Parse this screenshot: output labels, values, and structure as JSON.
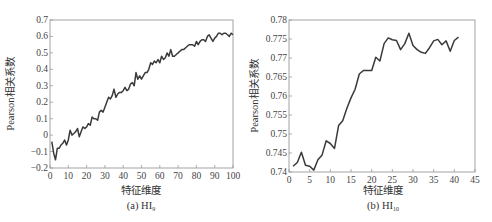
{
  "chart_data": [
    {
      "type": "line",
      "caption": "(a) HI",
      "caption_sub": "9",
      "title": "",
      "xlabel": "特征维度",
      "ylabel": "Pearson相关系数",
      "xlim": [
        0,
        100
      ],
      "ylim": [
        -0.2,
        0.7
      ],
      "xticks": [
        0,
        10,
        20,
        30,
        40,
        50,
        60,
        70,
        80,
        90,
        100
      ],
      "yticks": [
        -0.2,
        -0.1,
        0,
        0.1,
        0.2,
        0.3,
        0.4,
        0.5,
        0.6,
        0.7
      ],
      "ytick_labels": [
        "−0.2",
        "−0.1",
        "0",
        "0.1",
        "0.2",
        "0.3",
        "0.4",
        "0.5",
        "0.6",
        "0.7"
      ],
      "grid": false,
      "series": [
        {
          "name": "HI9",
          "x": [
            1,
            2,
            3,
            4,
            5,
            6,
            7,
            8,
            9,
            10,
            11,
            12,
            13,
            14,
            15,
            16,
            17,
            18,
            19,
            20,
            21,
            22,
            23,
            24,
            25,
            26,
            27,
            28,
            29,
            30,
            31,
            32,
            33,
            34,
            35,
            36,
            37,
            38,
            39,
            40,
            41,
            42,
            43,
            44,
            45,
            46,
            47,
            48,
            49,
            50,
            51,
            52,
            53,
            54,
            55,
            56,
            57,
            58,
            59,
            60,
            61,
            62,
            63,
            64,
            65,
            66,
            67,
            68,
            69,
            70,
            71,
            72,
            73,
            74,
            75,
            76,
            77,
            78,
            79,
            80,
            81,
            82,
            83,
            84,
            85,
            86,
            87,
            88,
            89,
            90,
            91,
            92,
            93,
            94,
            95,
            96,
            97,
            98,
            99,
            100
          ],
          "values": [
            -0.04,
            -0.11,
            -0.15,
            -0.08,
            -0.08,
            -0.06,
            -0.05,
            -0.03,
            -0.06,
            -0.03,
            0.03,
            0.0,
            0.01,
            0.02,
            0.04,
            -0.01,
            0.02,
            0.05,
            0.04,
            0.05,
            0.07,
            0.06,
            0.11,
            0.1,
            0.1,
            0.09,
            0.14,
            0.15,
            0.14,
            0.17,
            0.2,
            0.23,
            0.22,
            0.24,
            0.28,
            0.23,
            0.25,
            0.26,
            0.26,
            0.27,
            0.29,
            0.27,
            0.28,
            0.31,
            0.32,
            0.3,
            0.38,
            0.34,
            0.36,
            0.34,
            0.36,
            0.38,
            0.38,
            0.4,
            0.44,
            0.43,
            0.45,
            0.44,
            0.46,
            0.44,
            0.48,
            0.46,
            0.47,
            0.5,
            0.48,
            0.52,
            0.48,
            0.48,
            0.49,
            0.5,
            0.51,
            0.52,
            0.52,
            0.53,
            0.54,
            0.55,
            0.55,
            0.55,
            0.54,
            0.57,
            0.55,
            0.57,
            0.58,
            0.58,
            0.57,
            0.6,
            0.61,
            0.59,
            0.57,
            0.59,
            0.6,
            0.62,
            0.62,
            0.61,
            0.62,
            0.62,
            0.61,
            0.6,
            0.62,
            0.61
          ]
        }
      ]
    },
    {
      "type": "line",
      "caption": "(b) HI",
      "caption_sub": "10",
      "title": "",
      "xlabel": "特征维度",
      "ylabel": "Pearson相关系数",
      "xlim": [
        0,
        45
      ],
      "ylim": [
        0.74,
        0.78
      ],
      "xticks": [
        0,
        5,
        10,
        15,
        20,
        25,
        30,
        35,
        40,
        45
      ],
      "yticks": [
        0.74,
        0.745,
        0.75,
        0.755,
        0.76,
        0.765,
        0.77,
        0.775,
        0.78
      ],
      "ytick_labels": [
        "0.74",
        "0.745",
        "0.75",
        "0.755",
        "0.76",
        "0.765",
        "0.77",
        "0.775",
        "0.78"
      ],
      "grid": false,
      "series": [
        {
          "name": "HI10",
          "x": [
            1,
            2,
            3,
            4,
            5,
            6,
            7,
            8,
            9,
            10,
            11,
            12,
            13,
            14,
            15,
            16,
            17,
            18,
            19,
            20,
            21,
            22,
            23,
            24,
            25,
            26,
            27,
            28,
            29,
            30,
            31,
            32,
            33,
            34,
            35,
            36,
            37,
            38,
            39,
            40,
            41
          ],
          "values": [
            0.7415,
            0.7425,
            0.7452,
            0.7418,
            0.7415,
            0.7405,
            0.7432,
            0.7445,
            0.7482,
            0.7475,
            0.7462,
            0.7522,
            0.7535,
            0.7568,
            0.7595,
            0.7618,
            0.7658,
            0.7667,
            0.7667,
            0.7667,
            0.7702,
            0.7692,
            0.7738,
            0.7753,
            0.7748,
            0.7746,
            0.7722,
            0.7737,
            0.7765,
            0.7733,
            0.7722,
            0.7715,
            0.7712,
            0.7727,
            0.7745,
            0.7749,
            0.7735,
            0.7745,
            0.7718,
            0.7746,
            0.7755
          ]
        }
      ]
    }
  ]
}
